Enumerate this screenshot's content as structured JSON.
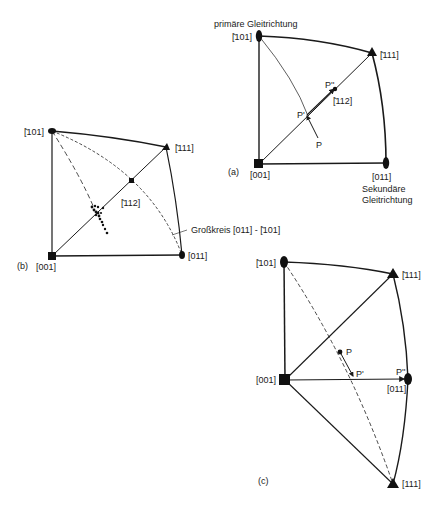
{
  "figure": {
    "panels": [
      {
        "id": "a",
        "label": "(a)",
        "corners": {
          "m101": "[̄101]",
          "m111": "[̄111]",
          "p001": "[001]",
          "p011": "[011]"
        },
        "m112": "[̄112]",
        "points": {
          "P": "P",
          "P1": "P'",
          "P2": "P''"
        },
        "primary_label": "primäre Gleitrichtung",
        "secondary_label_1": "Sekundäre",
        "secondary_label_2": "Gleitrichtung"
      },
      {
        "id": "b",
        "label": "(b)",
        "corners": {
          "m101": "[̄101]",
          "m111": "[̄111]",
          "p001": "[001]",
          "p011": "[011]"
        },
        "m112": "[̄112]",
        "great_circle_label": "Großkreis [011] - [̄101]"
      },
      {
        "id": "c",
        "label": "(c)",
        "corners": {
          "m101": "[̄101]",
          "m111": "[̄111]",
          "p001": "[001]",
          "p011": "[011]",
          "p111": "[111]"
        },
        "points": {
          "P": "P",
          "P1": "P'",
          "P2": "P''"
        }
      }
    ],
    "markers": {
      "square": "[001]",
      "ellipse": "<101> type",
      "triangle": "<111> type"
    }
  }
}
